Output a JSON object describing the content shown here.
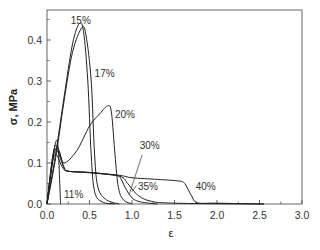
{
  "chart_data": {
    "type": "line",
    "title": "",
    "xlabel": "ε",
    "ylabel": "σ, MPa",
    "xlim": [
      0,
      3.0
    ],
    "ylim": [
      0,
      0.47
    ],
    "xticks": [
      0.0,
      0.5,
      1.0,
      1.5,
      2.0,
      2.5,
      3.0
    ],
    "xtick_labels": [
      "0.0",
      "0.5",
      "1.0",
      "1.5",
      "2.0",
      "2.5",
      "3.0"
    ],
    "yticks": [
      0.0,
      0.1,
      0.2,
      0.3,
      0.4
    ],
    "ytick_labels": [
      "0.0",
      "0.1",
      "0.2",
      "0.3",
      "0.4"
    ],
    "grid": false,
    "legend": "none (inline curve labels)",
    "series": [
      {
        "name": "11%",
        "points": [
          [
            0,
            0
          ],
          [
            0.05,
            0.08
          ],
          [
            0.1,
            0.15
          ],
          [
            0.13,
            0.14
          ],
          [
            0.15,
            0.05
          ],
          [
            0.16,
            0
          ]
        ]
      },
      {
        "name": "15%",
        "points": [
          [
            0,
            0
          ],
          [
            0.1,
            0.12
          ],
          [
            0.2,
            0.26
          ],
          [
            0.3,
            0.39
          ],
          [
            0.38,
            0.44
          ],
          [
            0.43,
            0.42
          ],
          [
            0.48,
            0.3
          ],
          [
            0.52,
            0.12
          ],
          [
            0.56,
            0.03
          ],
          [
            0.65,
            0.005
          ],
          [
            0.8,
            0
          ]
        ]
      },
      {
        "name": "17%",
        "points": [
          [
            0,
            0
          ],
          [
            0.1,
            0.11
          ],
          [
            0.2,
            0.25
          ],
          [
            0.3,
            0.37
          ],
          [
            0.41,
            0.43
          ],
          [
            0.46,
            0.41
          ],
          [
            0.52,
            0.3
          ],
          [
            0.56,
            0.12
          ],
          [
            0.6,
            0.04
          ],
          [
            0.7,
            0.01
          ],
          [
            0.85,
            0
          ]
        ]
      },
      {
        "name": "20%",
        "points": [
          [
            0,
            0
          ],
          [
            0.08,
            0.12
          ],
          [
            0.14,
            0.13
          ],
          [
            0.2,
            0.1
          ],
          [
            0.35,
            0.13
          ],
          [
            0.5,
            0.19
          ],
          [
            0.62,
            0.22
          ],
          [
            0.72,
            0.24
          ],
          [
            0.76,
            0.22
          ],
          [
            0.8,
            0.12
          ],
          [
            0.84,
            0.04
          ],
          [
            0.9,
            0.01
          ],
          [
            1.0,
            0
          ]
        ]
      },
      {
        "name": "30%",
        "points": [
          [
            0,
            0
          ],
          [
            0.08,
            0.13
          ],
          [
            0.13,
            0.135
          ],
          [
            0.2,
            0.09
          ],
          [
            0.25,
            0.08
          ],
          [
            0.5,
            0.077
          ],
          [
            0.8,
            0.07
          ],
          [
            0.86,
            0.065
          ],
          [
            0.92,
            0.04
          ],
          [
            1.0,
            0.015
          ],
          [
            1.1,
            0.005
          ],
          [
            1.3,
            0
          ]
        ]
      },
      {
        "name": "35%",
        "points": [
          [
            0,
            0
          ],
          [
            0.07,
            0.12
          ],
          [
            0.12,
            0.13
          ],
          [
            0.2,
            0.088
          ],
          [
            0.25,
            0.08
          ],
          [
            0.5,
            0.076
          ],
          [
            0.85,
            0.068
          ],
          [
            0.95,
            0.05
          ],
          [
            1.05,
            0.025
          ],
          [
            1.2,
            0.008
          ],
          [
            1.5,
            0.002
          ],
          [
            2.55,
            0
          ]
        ]
      },
      {
        "name": "40%",
        "points": [
          [
            0,
            0
          ],
          [
            0.06,
            0.1
          ],
          [
            0.11,
            0.12
          ],
          [
            0.18,
            0.09
          ],
          [
            0.25,
            0.08
          ],
          [
            0.5,
            0.077
          ],
          [
            0.85,
            0.07
          ],
          [
            1.0,
            0.064
          ],
          [
            1.3,
            0.06
          ],
          [
            1.55,
            0.056
          ],
          [
            1.62,
            0.05
          ],
          [
            1.7,
            0.02
          ],
          [
            1.77,
            0.003
          ],
          [
            2.0,
            0.002
          ],
          [
            2.55,
            0
          ]
        ]
      }
    ],
    "annotations": [
      {
        "text": "15%",
        "x": 0.28,
        "y": 0.438
      },
      {
        "text": "17%",
        "x": 0.56,
        "y": 0.31
      },
      {
        "text": "20%",
        "x": 0.8,
        "y": 0.21
      },
      {
        "text": "30%",
        "x": 1.09,
        "y": 0.135
      },
      {
        "text": "35%",
        "x": 1.07,
        "y": 0.035
      },
      {
        "text": "40%",
        "x": 1.75,
        "y": 0.035
      },
      {
        "text": "11%",
        "x": 0.2,
        "y": 0.015
      }
    ]
  },
  "labels": {
    "xlabel": "ε",
    "ylabel": "σ, MPa"
  }
}
